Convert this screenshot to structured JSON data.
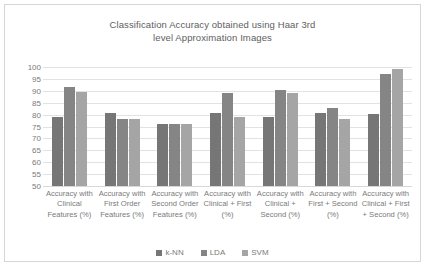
{
  "chart_data": {
    "type": "bar",
    "title": "Classification Accuracy obtained using Haar 3rd level Approximation Images",
    "title_lines": [
      "Classification Accuracy obtained using Haar 3rd",
      "level Approximation Images"
    ],
    "xlabel": "",
    "ylabel": "",
    "ylim": [
      50,
      100
    ],
    "ytick_step": 5,
    "yticks": [
      100,
      95,
      90,
      85,
      80,
      75,
      70,
      65,
      60,
      55,
      50
    ],
    "grid": true,
    "legend_position": "bottom",
    "categories": [
      "Accuracy with Clinical Features (%)",
      "Accuracy with First Order Features (%)",
      "Accuracy with Second Order Features (%)",
      "Accuracy with Clinical + First (%)",
      "Accuracy with Clinical + Second (%)",
      "Accuracy with First + Second (%)",
      "Accuracy with Clinical + First + Second (%)"
    ],
    "series": [
      {
        "name": "k-NN",
        "color": "#767676",
        "values": [
          79.0,
          80.8,
          76.0,
          80.5,
          78.8,
          80.6,
          80.4
        ]
      },
      {
        "name": "LDA",
        "color": "#858585",
        "values": [
          91.4,
          78.0,
          76.2,
          88.9,
          90.3,
          82.7,
          97.0
        ]
      },
      {
        "name": "SVM",
        "color": "#a5a5a5",
        "values": [
          89.5,
          78.3,
          75.9,
          79.0,
          89.2,
          78.1,
          99.0
        ]
      }
    ]
  }
}
